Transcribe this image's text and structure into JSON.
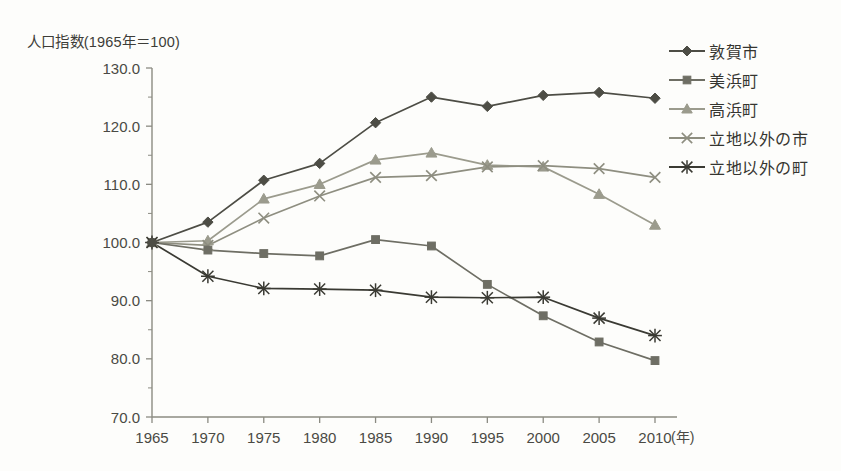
{
  "chart_data": {
    "type": "line",
    "title": "人口指数(1965年＝100)",
    "xlabel": "(年)",
    "ylabel": "人口指数(1965年＝100)",
    "x": [
      1965,
      1970,
      1975,
      1980,
      1985,
      1990,
      1995,
      2000,
      2005,
      2010
    ],
    "categories": [
      "1965",
      "1970",
      "1975",
      "1980",
      "1985",
      "1990",
      "1995",
      "2000",
      "2005",
      "2010"
    ],
    "xlim": [
      1965,
      2010
    ],
    "ylim": [
      70.0,
      130.0
    ],
    "ytick_labels": [
      "130.0",
      "120.0",
      "110.0",
      "100.0",
      "90.0",
      "80.0",
      "70.0"
    ],
    "ytick_values": [
      130.0,
      120.0,
      110.0,
      100.0,
      90.0,
      80.0,
      70.0
    ],
    "grid": false,
    "legend_position": "right",
    "series": [
      {
        "name": "敦賀市",
        "marker": "diamond",
        "color": "#4d4d45",
        "values": [
          100.0,
          103.5,
          110.7,
          113.6,
          120.6,
          125.0,
          123.4,
          125.3,
          125.8,
          124.8
        ]
      },
      {
        "name": "美浜町",
        "marker": "square",
        "color": "#6e6e64",
        "values": [
          100.0,
          98.7,
          98.1,
          97.7,
          100.5,
          99.4,
          92.8,
          87.4,
          82.9,
          79.7
        ]
      },
      {
        "name": "高浜町",
        "marker": "triangle",
        "color": "#9b9b8d",
        "values": [
          100.0,
          100.3,
          107.5,
          110.0,
          114.2,
          115.4,
          113.3,
          113.0,
          108.3,
          103.0
        ]
      },
      {
        "name": "立地以外の市",
        "marker": "x",
        "color": "#8e8e80",
        "values": [
          100.0,
          99.5,
          104.2,
          108.0,
          111.2,
          111.5,
          113.0,
          113.2,
          112.7,
          111.2
        ]
      },
      {
        "name": "立地以外の町",
        "marker": "asterisk",
        "color": "#3a3a33",
        "values": [
          100.0,
          94.2,
          92.1,
          92.0,
          91.8,
          90.6,
          90.5,
          90.6,
          87.0,
          84.0
        ]
      }
    ]
  },
  "axes": {
    "y_axis_name": "y-axis",
    "x_axis_name": "x-axis",
    "x_unit": "(年)"
  }
}
